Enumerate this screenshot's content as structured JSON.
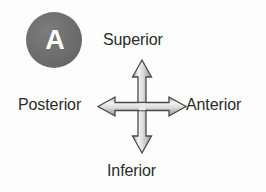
{
  "figure": {
    "type": "anatomical-orientation-diagram",
    "background_color": "#fdfdfd",
    "text_color": "#2b2b2b"
  },
  "panel": {
    "letter": "A",
    "badge_fill": "#6e6e6e",
    "letter_color": "#ffffff"
  },
  "axes": {
    "superior": "Superior",
    "inferior": "Inferior",
    "anterior": "Anterior",
    "posterior": "Posterior"
  },
  "cross_arrow": {
    "name": "four-way-arrow",
    "outline_color": "#4a4a4a",
    "fill_light": "#f2f2f2",
    "fill_mid": "#bdbdbd",
    "fill_dark": "#8e8e8e",
    "directions": [
      "up",
      "down",
      "left",
      "right"
    ]
  }
}
